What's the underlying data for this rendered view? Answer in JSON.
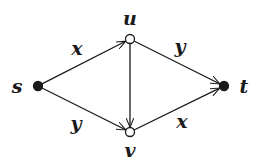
{
  "diagram": {
    "type": "directed-graph",
    "nodes": [
      {
        "id": "s",
        "label": "s",
        "x": 38,
        "y": 86,
        "style": "filled",
        "label_x": 17,
        "label_y": 93
      },
      {
        "id": "u",
        "label": "u",
        "x": 130,
        "y": 39,
        "style": "hollow",
        "label_x": 130,
        "label_y": 25
      },
      {
        "id": "v",
        "label": "v",
        "x": 130,
        "y": 132,
        "style": "hollow",
        "label_x": 130,
        "label_y": 157
      },
      {
        "id": "t",
        "label": "t",
        "x": 224,
        "y": 86,
        "style": "filled",
        "label_x": 244,
        "label_y": 93
      }
    ],
    "edges": [
      {
        "from": "s",
        "to": "u",
        "label": "x",
        "label_x": 77,
        "label_y": 55
      },
      {
        "from": "u",
        "to": "t",
        "label": "y",
        "label_x": 180,
        "label_y": 53
      },
      {
        "from": "s",
        "to": "v",
        "label": "y",
        "label_x": 76,
        "label_y": 130
      },
      {
        "from": "v",
        "to": "t",
        "label": "x",
        "label_x": 182,
        "label_y": 128
      },
      {
        "from": "u",
        "to": "v",
        "label": ""
      }
    ],
    "colors": {
      "ink": "#1a1a1a",
      "background": "#ffffff"
    }
  }
}
